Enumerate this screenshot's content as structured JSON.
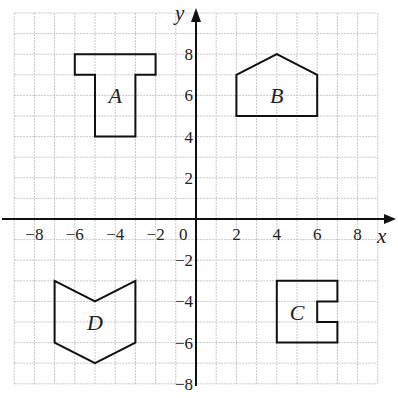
{
  "diagram": {
    "type": "coordinate-grid",
    "axes": {
      "x_label": "x",
      "y_label": "y",
      "x_range": [
        -9,
        9
      ],
      "y_range": [
        -8,
        10
      ],
      "origin_label": "0",
      "x_ticks": [
        {
          "value": -8,
          "label": "−8"
        },
        {
          "value": -6,
          "label": "−6"
        },
        {
          "value": -4,
          "label": "−4"
        },
        {
          "value": -2,
          "label": "−2"
        },
        {
          "value": 2,
          "label": "2"
        },
        {
          "value": 4,
          "label": "4"
        },
        {
          "value": 6,
          "label": "6"
        },
        {
          "value": 8,
          "label": "8"
        }
      ],
      "y_ticks": [
        {
          "value": 8,
          "label": "8"
        },
        {
          "value": 6,
          "label": "6"
        },
        {
          "value": 4,
          "label": "4"
        },
        {
          "value": 2,
          "label": "2"
        },
        {
          "value": -2,
          "label": "−2"
        },
        {
          "value": -4,
          "label": "−4"
        },
        {
          "value": -6,
          "label": "−6"
        },
        {
          "value": -8,
          "label": "−8"
        }
      ]
    },
    "shapes": [
      {
        "name": "A",
        "label": "A",
        "label_pos": [
          -4,
          6
        ],
        "vertices": [
          [
            -6,
            8
          ],
          [
            -2,
            8
          ],
          [
            -2,
            7
          ],
          [
            -3,
            7
          ],
          [
            -3,
            4
          ],
          [
            -5,
            4
          ],
          [
            -5,
            7
          ],
          [
            -6,
            7
          ]
        ]
      },
      {
        "name": "B",
        "label": "B",
        "label_pos": [
          4,
          6
        ],
        "vertices": [
          [
            2,
            5
          ],
          [
            2,
            7
          ],
          [
            4,
            8
          ],
          [
            6,
            7
          ],
          [
            6,
            5
          ]
        ]
      },
      {
        "name": "C",
        "label": "C",
        "label_pos": [
          5,
          -4.5
        ],
        "vertices": [
          [
            4,
            -3
          ],
          [
            7,
            -3
          ],
          [
            7,
            -4
          ],
          [
            6,
            -4
          ],
          [
            6,
            -5
          ],
          [
            7,
            -5
          ],
          [
            7,
            -6
          ],
          [
            4,
            -6
          ]
        ]
      },
      {
        "name": "D",
        "label": "D",
        "label_pos": [
          -5,
          -5
        ],
        "vertices": [
          [
            -7,
            -3
          ],
          [
            -5,
            -4
          ],
          [
            -3,
            -3
          ],
          [
            -3,
            -6
          ],
          [
            -5,
            -7
          ],
          [
            -7,
            -6
          ]
        ]
      }
    ],
    "colors": {
      "grid": "#c8c8c8",
      "axis": "#111111",
      "shape_stroke": "#111111",
      "text": "#222222",
      "background": "#ffffff"
    }
  }
}
